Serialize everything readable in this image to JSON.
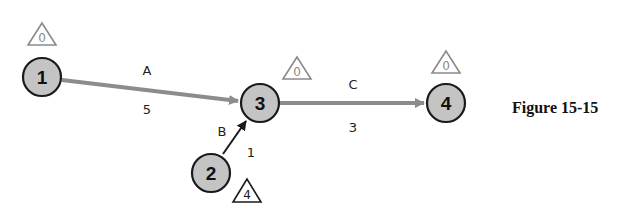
{
  "figure": {
    "caption": "Figure 15-15"
  },
  "colors": {
    "node_fill": "#c4c4c4",
    "edge_gray": "#8c8c8c",
    "edge_dark": "#1a1a1a"
  },
  "nodes": [
    {
      "id": "1",
      "label": "1",
      "slack": "0"
    },
    {
      "id": "2",
      "label": "2",
      "slack": "4"
    },
    {
      "id": "3",
      "label": "3",
      "slack": "0"
    },
    {
      "id": "4",
      "label": "4",
      "slack": "0"
    }
  ],
  "edges": [
    {
      "from": "1",
      "to": "3",
      "activity": "A",
      "duration": "5",
      "critical": true
    },
    {
      "from": "2",
      "to": "3",
      "activity": "B",
      "duration": "1",
      "critical": false
    },
    {
      "from": "3",
      "to": "4",
      "activity": "C",
      "duration": "3",
      "critical": true
    }
  ]
}
